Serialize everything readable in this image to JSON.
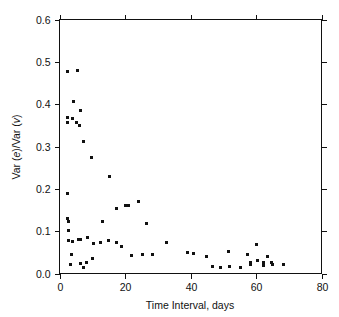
{
  "chart_data": {
    "type": "scatter",
    "title": "",
    "xlabel": "Time Interval, days",
    "ylabel": "Var (e)/Var (v)",
    "ylabel_parts": [
      "Var (",
      "e",
      ")/Var (",
      "v",
      ")"
    ],
    "xlim": [
      0,
      80
    ],
    "ylim": [
      0.0,
      0.6
    ],
    "xticks": [
      0,
      20,
      40,
      60,
      80
    ],
    "yticks": [
      0.0,
      0.1,
      0.2,
      0.3,
      0.4,
      0.5,
      0.6
    ],
    "xtick_labels": [
      "0",
      "20",
      "40",
      "60",
      "80"
    ],
    "ytick_labels": [
      "0.0",
      "0.1",
      "0.2",
      "0.3",
      "0.4",
      "0.5",
      "0.6"
    ],
    "grid": false,
    "legend": null,
    "marker": "square",
    "marker_color": "#111111",
    "marker_size": 3,
    "points": [
      [
        2.3,
        0.478
      ],
      [
        5.6,
        0.479
      ],
      [
        4.3,
        0.406
      ],
      [
        6.4,
        0.386
      ],
      [
        2.5,
        0.368
      ],
      [
        2.5,
        0.356
      ],
      [
        4.1,
        0.365
      ],
      [
        5.1,
        0.357
      ],
      [
        6.0,
        0.349
      ],
      [
        7.3,
        0.312
      ],
      [
        9.8,
        0.273
      ],
      [
        15.4,
        0.229
      ],
      [
        2.5,
        0.19
      ],
      [
        2.5,
        0.13
      ],
      [
        2.6,
        0.122
      ],
      [
        2.6,
        0.102
      ],
      [
        2.6,
        0.079
      ],
      [
        13.0,
        0.122
      ],
      [
        17.4,
        0.154
      ],
      [
        20.0,
        0.16
      ],
      [
        21.2,
        0.161
      ],
      [
        24.0,
        0.17
      ],
      [
        26.6,
        0.117
      ],
      [
        4.0,
        0.075
      ],
      [
        5.8,
        0.081
      ],
      [
        6.5,
        0.08
      ],
      [
        8.6,
        0.086
      ],
      [
        10.5,
        0.072
      ],
      [
        12.6,
        0.073
      ],
      [
        15.0,
        0.078
      ],
      [
        17.5,
        0.074
      ],
      [
        19.0,
        0.064
      ],
      [
        22.0,
        0.042
      ],
      [
        25.2,
        0.046
      ],
      [
        28.3,
        0.046
      ],
      [
        32.8,
        0.073
      ],
      [
        3.6,
        0.044
      ],
      [
        3.3,
        0.021
      ],
      [
        6.5,
        0.024
      ],
      [
        7.3,
        0.014
      ],
      [
        8.1,
        0.026
      ],
      [
        10.0,
        0.035
      ],
      [
        39.0,
        0.05
      ],
      [
        41.0,
        0.048
      ],
      [
        44.8,
        0.04
      ],
      [
        46.6,
        0.016
      ],
      [
        49.3,
        0.015
      ],
      [
        51.6,
        0.053
      ],
      [
        52.0,
        0.016
      ],
      [
        55.3,
        0.015
      ],
      [
        57.5,
        0.044
      ],
      [
        58.3,
        0.027
      ],
      [
        58.4,
        0.021
      ],
      [
        60.0,
        0.068
      ],
      [
        60.6,
        0.031
      ],
      [
        62.2,
        0.027
      ],
      [
        62.3,
        0.019
      ],
      [
        63.5,
        0.04
      ],
      [
        64.6,
        0.025
      ],
      [
        65.0,
        0.022
      ],
      [
        68.3,
        0.021
      ]
    ]
  },
  "axes": {
    "x_title": "Time Interval, days",
    "y_title_prefix": "Var (",
    "y_title_italic1": "e",
    "y_title_middle": ")/Var (",
    "y_title_italic2": "v",
    "y_title_suffix": ")"
  }
}
